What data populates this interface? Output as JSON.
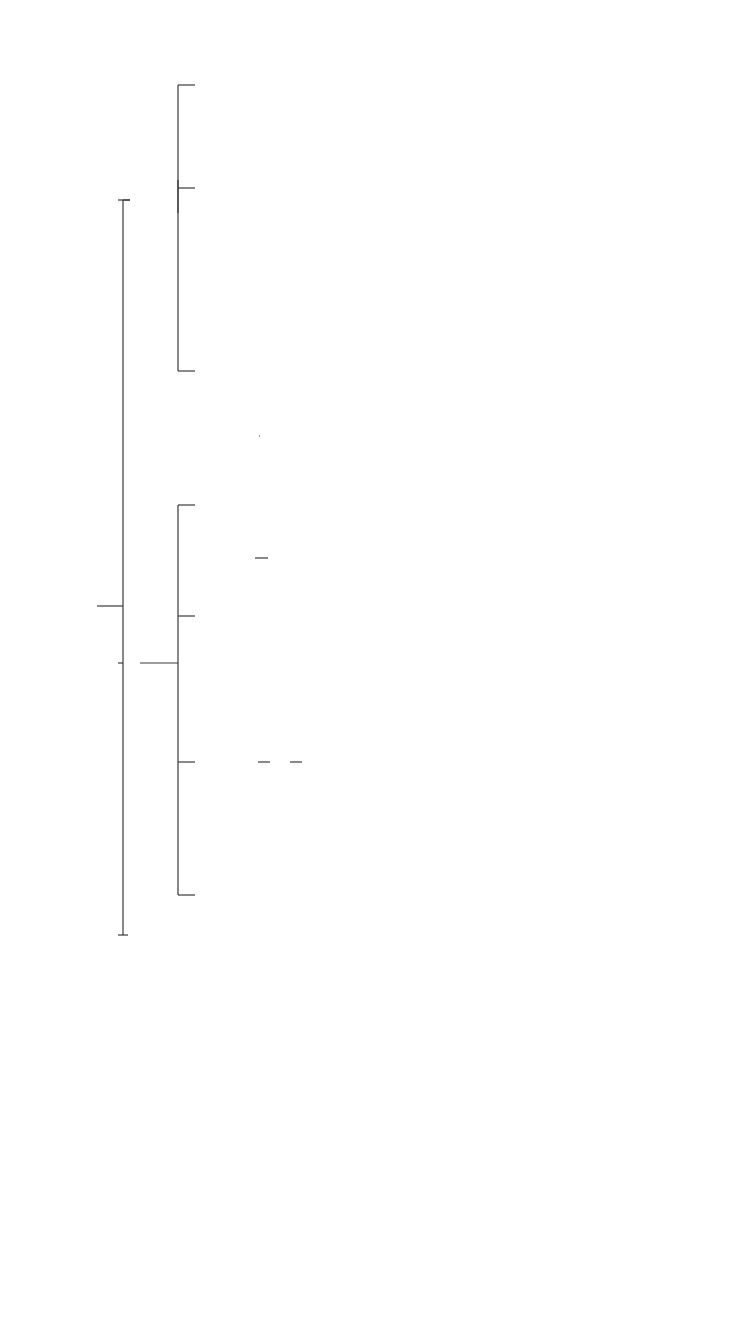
{
  "legend": {
    "married": "m. = married",
    "speculated": "sm. = speculated marriage",
    "dates": "(bracketed dates) = reigns of throned kings"
  },
  "root": {
    "name": "Amyntas III",
    "dates": "(393 - 370/369)"
  },
  "wives_of_amyntas": [
    {
      "label": "m.Gygaea"
    },
    {
      "label": "m.Eurydice"
    }
  ],
  "children_gygaea": [
    {
      "name": "Archelaus"
    },
    {
      "name": "Arrhidaeus"
    },
    {
      "name": "Menelaus"
    }
  ],
  "children_eurydice": [
    {
      "name": "Eurynoe",
      "note": "sm.",
      "spouse": "Ptolemy of Alorus",
      "spouse_dates": "(369-365)"
    },
    {
      "name": "Alexander II",
      "dates": "(370/369-367)"
    },
    {
      "name": "Perdiccas II",
      "dates": "(365/360-359)",
      "child": "Amyntas",
      "grandchild": "Adea Eurydice",
      "grandchild_note": "(by Cynnane)"
    },
    {
      "name": "Philip II",
      "dates": "(359/358-336)"
    }
  ],
  "wives_of_philip": [
    {
      "label": "m. Audata",
      "child": "Cynanne",
      "grandchild": "Adea Eurydice",
      "grandchild_note": "(by Amyntas)"
    },
    {
      "label": "m. Phila"
    },
    {
      "label": "m. Nicesipolis",
      "child": "Thessalonice",
      "grandchild": "3 sons",
      "grandchild_note": "(by Cassander)",
      "grandchild_dates": "(315-297)"
    },
    {
      "label": "m. Philinna",
      "child": "Philip III Arrhidaeus",
      "child_dates": "(323-316)"
    },
    {
      "label": "m. Olympias"
    },
    {
      "label": "m. Meda"
    },
    {
      "label": "m. Cleopatra",
      "child": "Europa"
    }
  ],
  "children_olympias": [
    {
      "name": "Alexander III “The Great”",
      "dates": "(336-323)"
    },
    {
      "name": "Cleopatra",
      "child": "2 children",
      "child_note": "(by Alexander Molossus)"
    }
  ],
  "wives_of_alexander": [
    {
      "label": "Barsine",
      "child": "Heracles"
    },
    {
      "label": "m.Rhoxane",
      "child": "Alexander IV",
      "child_dates": "(323-311/310)"
    },
    {
      "label": "m. Stateira"
    },
    {
      "label": "m. Parysatis"
    }
  ]
}
